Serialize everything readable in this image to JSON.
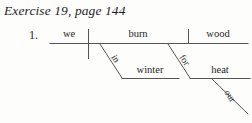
{
  "heading": {
    "title": "Exercise 19, page 144"
  },
  "diagram": {
    "item_number": "1.",
    "type": "reed-kellogg-sentence-diagram",
    "ink_color": "#555555",
    "text_color": "#262626",
    "background_color": "#fdfdfc",
    "baseline": {
      "subject": "we",
      "verb": "burn",
      "direct_object": "wood"
    },
    "prepositional_phrases": [
      {
        "preposition": "in",
        "object": "winter",
        "attached_to": "burn"
      },
      {
        "preposition": "for",
        "object": "heat",
        "attached_to": "burn"
      }
    ],
    "modifiers": [
      {
        "word": "our",
        "modifies": "heat"
      }
    ],
    "sentence": "we burn wood in winter for our heat"
  }
}
